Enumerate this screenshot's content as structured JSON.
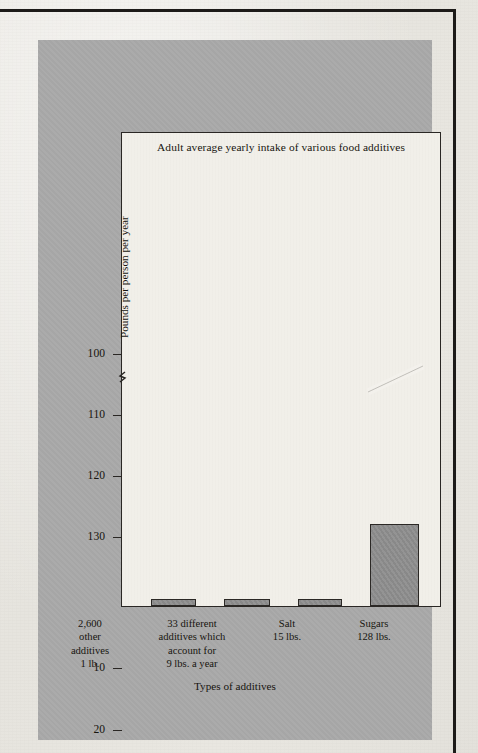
{
  "page": {
    "bleed_text": [
      "nitrates and nitrites which are used in the curing of",
      "meats such as bacon, ham and frankfurters have been",
      "under study for some years. In the stomach these",
      "substances may combine with amines to form",
      "nitrosamines, a family of compounds which have been",
      "shown to cause cancer in laboratory animals. The",
      "quantities involved are extremely small, but because",
      "the effect may be cumulative the question remains",
      "open and is the subject of continuing research by",
      "the Food and Drug Administration."
    ],
    "bleed_text_lower": [
      "the amount of sugar consumed by the average adult",
      "in a single year is greater than the combined total",
      "of every other additive used by the food industry.",
      "Much of this is hidden in processed foods such as",
      "breakfast cereals, soft drinks, catsup and canned",
      "soups, where the consumer is often unaware of its",
      "presence."
    ]
  },
  "chart_data": {
    "type": "bar",
    "title": "Adult average yearly intake of various food additives",
    "xlabel": "Types of additives",
    "ylabel": "Pounds per person per year",
    "categories": [
      "2,600\nother\nadditives\n1 lb.",
      "33 different\nadditives which\naccount for\n9 lbs. a year",
      "Salt\n15 lbs.",
      "Sugars\n128 lbs."
    ],
    "category_lines": [
      [
        "2,600",
        "other",
        "additives",
        "1 lb."
      ],
      [
        "33 different",
        "additives which",
        "account for",
        "9 lbs. a year"
      ],
      [
        "Salt",
        "15 lbs."
      ],
      [
        "Sugars",
        "128 lbs."
      ]
    ],
    "values": [
      1,
      9,
      15,
      128
    ],
    "value_labels": [
      "1 lb.",
      "9 lbs. a year",
      "15 lbs.",
      "128 lbs."
    ],
    "ytick_labels": [
      "130",
      "120",
      "110",
      "100",
      "30",
      "20",
      "10"
    ],
    "ytick_values": [
      130,
      120,
      110,
      100,
      30,
      20,
      10
    ],
    "axis_break": true,
    "axis_break_between": [
      100,
      30
    ],
    "bar_break_marker": "white diagonal slash across Sugars bar",
    "grid": false,
    "legend": false,
    "bar_color": "#8e8e8e",
    "bar_edge_color": "#2b2825",
    "plot_background": "#f1efe9",
    "panel_background": "#a9a9a9"
  }
}
